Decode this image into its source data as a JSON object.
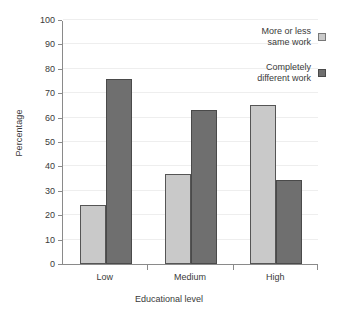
{
  "chart_data": {
    "type": "bar",
    "title": "",
    "xlabel": "Educational level",
    "ylabel": "Percentage",
    "categories": [
      "Low",
      "Medium",
      "High"
    ],
    "ylim": [
      0,
      100
    ],
    "yticks": [
      0,
      10,
      20,
      30,
      40,
      50,
      60,
      70,
      80,
      90,
      100
    ],
    "grid": true,
    "legend_position": "top-right",
    "series": [
      {
        "name": "More or less\nsame work",
        "color": "#c9c9c9",
        "values": [
          24,
          37,
          65
        ]
      },
      {
        "name": "Completely\ndifferent work",
        "color": "#6f6f6f",
        "values": [
          76,
          63,
          34.5
        ]
      }
    ]
  }
}
